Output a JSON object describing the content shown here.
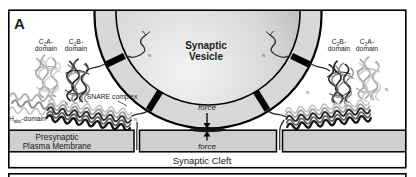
{
  "panel_label": "A",
  "vesicle": {
    "line1": "Synaptic",
    "line2": "Vesicle"
  },
  "labels": {
    "left_c2a": {
      "pre": "C",
      "sub": "2",
      "post": "A-",
      "line2": "domain"
    },
    "left_c2b": {
      "pre": "C",
      "sub": "2",
      "post": "B-",
      "line2": "domain"
    },
    "right_c2b": {
      "pre": "C",
      "sub": "2",
      "post": "B-",
      "line2": "domain"
    },
    "right_c2a": {
      "pre": "C",
      "sub": "2",
      "post": "A-",
      "line2": "domain"
    },
    "habc": {
      "pre": "H",
      "sub": "abc",
      "post": "-domain"
    },
    "snare": "SNARE complex"
  },
  "membrane": {
    "line1": "Presynaptic",
    "line2": "Plasma Membrane"
  },
  "cleft": "Synaptic Cleft",
  "force": {
    "upper": "force",
    "lower": "force"
  },
  "termini": {
    "n": "N"
  },
  "colors": {
    "ring": "#d8d8d8",
    "membrane": "#cfcfcf",
    "vesicle_light": "#f3f3f3",
    "vesicle_mid": "#d8d8d8",
    "vesicle_dark": "#989898",
    "outline": "#000000"
  }
}
